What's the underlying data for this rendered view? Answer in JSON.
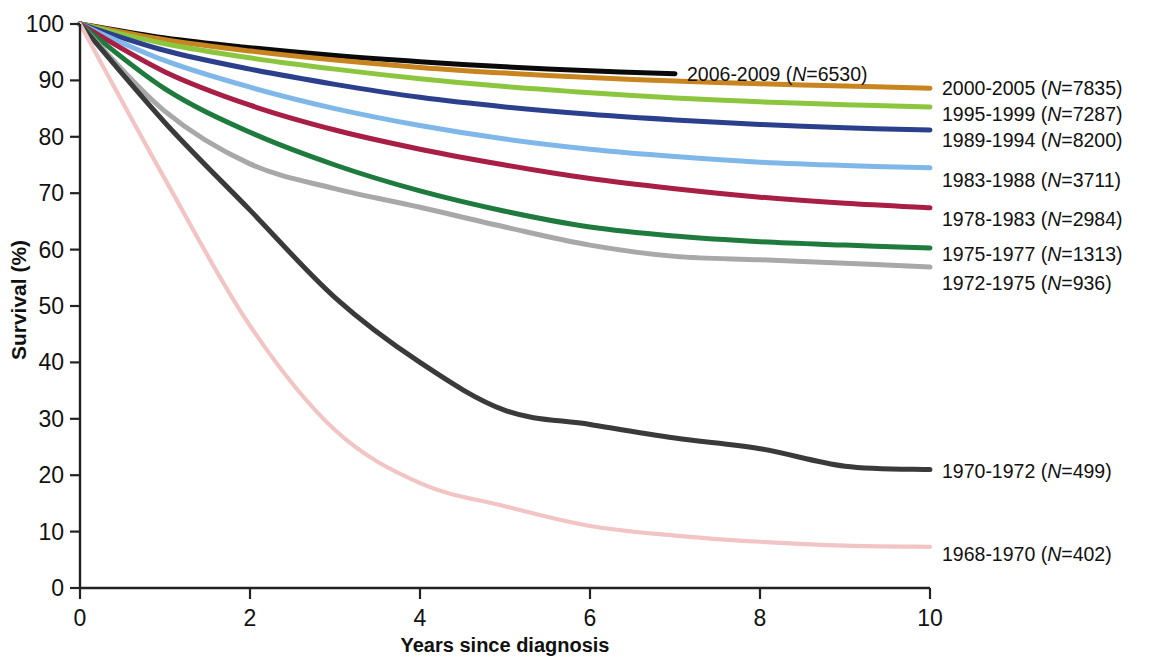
{
  "chart_data": {
    "type": "line",
    "title": "",
    "subtitle": "",
    "xlabel": "Years since diagnosis",
    "ylabel": "Survival (%)",
    "xlim": [
      0,
      10
    ],
    "ylim": [
      0,
      100
    ],
    "xticks": [
      "0",
      "2",
      "4",
      "6",
      "8",
      "10"
    ],
    "xtick_values": [
      0,
      2,
      4,
      6,
      8,
      10
    ],
    "yticks": [
      "0",
      "10",
      "20",
      "30",
      "40",
      "50",
      "60",
      "70",
      "80",
      "90",
      "100"
    ],
    "ytick_values": [
      0,
      10,
      20,
      30,
      40,
      50,
      60,
      70,
      80,
      90,
      100
    ],
    "grid": false,
    "legend_position": "right-inline-at-curve-end",
    "x": [
      0,
      1,
      2,
      3,
      4,
      5,
      6,
      7,
      8,
      9,
      10
    ],
    "series": [
      {
        "name": "2006-2009",
        "label": "2006-2009 (N=6530)",
        "period": "2006-2009",
        "n": 6530,
        "color": "#0a0a0a",
        "x": [
          0,
          1,
          2,
          3,
          4,
          5,
          6,
          7
        ],
        "values": [
          100,
          97.5,
          95.8,
          94.4,
          93.3,
          92.4,
          91.7,
          91.2
        ]
      },
      {
        "name": "2000-2005",
        "label": "2000-2005 (N=7835)",
        "period": "2000-2005",
        "n": 7835,
        "color": "#c8841e",
        "x": [
          0,
          1,
          2,
          3,
          4,
          5,
          6,
          7,
          8,
          9,
          10
        ],
        "values": [
          100,
          97.2,
          95.2,
          93.6,
          92.3,
          91.3,
          90.5,
          89.9,
          89.4,
          89.0,
          88.6
        ]
      },
      {
        "name": "1995-1999",
        "label": "1995-1999 (N=7287)",
        "period": "1995-1999",
        "n": 7287,
        "color": "#8cc63f",
        "x": [
          0,
          1,
          2,
          3,
          4,
          5,
          6,
          7,
          8,
          9,
          10
        ],
        "values": [
          100,
          96.5,
          94.0,
          92.0,
          90.3,
          88.9,
          87.8,
          86.9,
          86.2,
          85.7,
          85.3
        ]
      },
      {
        "name": "1989-1994",
        "label": "1989-1994 (N=8200)",
        "period": "1989-1994",
        "n": 8200,
        "color": "#2b3f8c",
        "x": [
          0,
          1,
          2,
          3,
          4,
          5,
          6,
          7,
          8,
          9,
          10
        ],
        "values": [
          100,
          95.3,
          92.0,
          89.3,
          87.0,
          85.3,
          84.0,
          83.0,
          82.2,
          81.6,
          81.2
        ]
      },
      {
        "name": "1983-1988",
        "label": "1983-1988 (N=3711)",
        "period": "1983-1988",
        "n": 3711,
        "color": "#7fb8e8",
        "x": [
          0,
          1,
          2,
          3,
          4,
          5,
          6,
          7,
          8,
          9,
          10
        ],
        "values": [
          100,
          93.5,
          88.8,
          85.0,
          82.0,
          79.6,
          77.8,
          76.5,
          75.5,
          74.9,
          74.5
        ]
      },
      {
        "name": "1978-1983",
        "label": "1978-1983 (N=2984)",
        "period": "1978-1983",
        "n": 2984,
        "color": "#a81e45",
        "x": [
          0,
          1,
          2,
          3,
          4,
          5,
          6,
          7,
          8,
          9,
          10
        ],
        "values": [
          100,
          91.5,
          85.6,
          81.2,
          77.8,
          75.0,
          72.6,
          70.8,
          69.3,
          68.2,
          67.4
        ]
      },
      {
        "name": "1975-1977",
        "label": "1975-1977 (N=1313)",
        "period": "1975-1977",
        "n": 1313,
        "color": "#1f7a3d",
        "x": [
          0,
          1,
          2,
          3,
          4,
          5,
          6,
          7,
          8,
          9,
          10
        ],
        "values": [
          100,
          88.5,
          80.8,
          75.0,
          70.4,
          66.8,
          64.0,
          62.4,
          61.4,
          60.8,
          60.3
        ]
      },
      {
        "name": "1972-1975",
        "label": "1972-1975 (N=936)",
        "period": "1972-1975",
        "n": 936,
        "color": "#a8a8a8",
        "x": [
          0,
          1,
          2,
          3,
          4,
          5,
          6,
          7,
          8,
          9,
          10
        ],
        "values": [
          100,
          84.5,
          75.2,
          70.8,
          67.5,
          64.0,
          60.8,
          58.8,
          58.2,
          57.6,
          56.9
        ]
      },
      {
        "name": "1970-1972",
        "label": "1970-1972 (N=499)",
        "period": "1970-1972",
        "n": 499,
        "color": "#3a3a3a",
        "x": [
          0,
          1,
          2,
          3,
          4,
          5,
          6,
          7,
          8,
          9,
          10
        ],
        "values": [
          100,
          82.5,
          67.0,
          51.5,
          40.0,
          31.5,
          29.0,
          26.6,
          24.7,
          21.6,
          21.0
        ]
      },
      {
        "name": "1968-1970",
        "label": "1968-1970 (N=402)",
        "period": "1968-1970",
        "n": 402,
        "color": "#f2c4c4",
        "x": [
          0,
          1,
          2,
          3,
          4,
          5,
          6,
          7,
          8,
          9,
          10
        ],
        "values": [
          100,
          72.5,
          46.5,
          28.0,
          18.6,
          14.5,
          11.0,
          9.3,
          8.2,
          7.5,
          7.3
        ]
      }
    ]
  },
  "axes": {
    "ylabel": "Survival (%)",
    "xlabel": "Years since diagnosis"
  }
}
